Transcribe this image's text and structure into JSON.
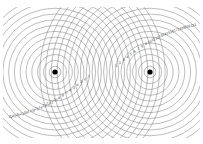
{
  "figure": {
    "background_color": "#ffffff",
    "wavefront_color": "#6b6b6b",
    "source_color": "#000000",
    "label_color": "#3a3a3a",
    "clip_shape": "rounded-rectangle"
  },
  "sources": [
    {
      "name": "source-left",
      "label": "S1",
      "x": 55,
      "y": 72,
      "radius": 2.6,
      "rings": 19,
      "ring_spacing": 5.8
    },
    {
      "name": "source-right",
      "label": "S2",
      "x": 150,
      "y": 72,
      "radius": 2.6,
      "rings": 19,
      "ring_spacing": 5.8
    }
  ],
  "clip": {
    "x": 3,
    "y": 7,
    "width": 197,
    "height": 131,
    "rx": 12,
    "ry": 10
  },
  "chart_data": {
    "type": "scatter",
    "xlabel": "",
    "ylabel": "",
    "xlim": [
      0,
      203
    ],
    "ylim": [
      0,
      144
    ],
    "grid": false,
    "legend": "none",
    "annotations": [
      "Concentric wavefronts from two coherent point sources",
      "Intersection loci form hyperbolic fringe lines",
      "Fringe order numbers run along both diagonals"
    ],
    "series": [
      {
        "name": "source-left-wavefronts",
        "center": [
          55,
          72
        ],
        "values": [
          5.8,
          11.6,
          17.4,
          23.2,
          29.0,
          34.8,
          40.6,
          46.4,
          52.2,
          58.0,
          63.8,
          69.6,
          75.4,
          81.2,
          87.0,
          92.8,
          98.6,
          104.4,
          110.2
        ]
      },
      {
        "name": "source-right-wavefronts",
        "center": [
          150,
          72
        ],
        "values": [
          5.8,
          11.6,
          17.4,
          23.2,
          29.0,
          34.8,
          40.6,
          46.4,
          52.2,
          58.0,
          63.8,
          69.6,
          75.4,
          81.2,
          87.0,
          92.8,
          98.6,
          104.4,
          110.2
        ]
      }
    ]
  },
  "fringe_labels_upper": [
    "1",
    "2",
    "3",
    "4",
    "5",
    "6",
    "7",
    "8",
    "9",
    "10",
    "11",
    "12",
    "13",
    "14",
    "15",
    "16",
    "17",
    "18",
    "19",
    "20",
    "21",
    "22"
  ],
  "fringe_labels_lower": [
    "1",
    "2",
    "3",
    "4",
    "5",
    "6",
    "7",
    "8",
    "9",
    "10",
    "11",
    "12",
    "13",
    "14",
    "15",
    "16",
    "17",
    "18",
    "19",
    "20",
    "21",
    "22"
  ]
}
